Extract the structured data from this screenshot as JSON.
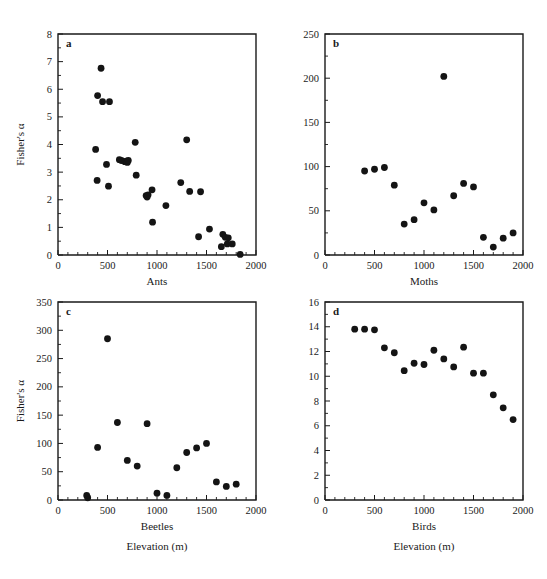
{
  "figure": {
    "y_axis_label": "Fisher's α",
    "shared_x_label": "Elevation (m)"
  },
  "chart_data": [
    {
      "type": "scatter",
      "panel": "a",
      "title": "",
      "xlabel": "Ants",
      "ylabel": "Fisher's α",
      "xlim": [
        0,
        2000
      ],
      "ylim": [
        0,
        8
      ],
      "xticks": [
        0,
        500,
        1000,
        1500,
        2000
      ],
      "yticks": [
        0,
        1,
        2,
        3,
        4,
        5,
        6,
        7,
        8
      ],
      "grid": false,
      "legend": "none",
      "x": [
        380,
        395,
        400,
        435,
        450,
        490,
        510,
        520,
        620,
        640,
        675,
        690,
        700,
        710,
        780,
        790,
        890,
        900,
        910,
        950,
        955,
        1090,
        1240,
        1300,
        1330,
        1420,
        1440,
        1530,
        1650,
        1665,
        1690,
        1710,
        1720,
        1760,
        1840
      ],
      "y": [
        3.82,
        2.7,
        5.77,
        6.76,
        5.55,
        3.28,
        2.49,
        5.55,
        3.45,
        3.42,
        3.38,
        3.4,
        3.35,
        3.42,
        4.08,
        2.89,
        2.15,
        2.1,
        2.18,
        2.36,
        1.19,
        1.79,
        2.62,
        4.17,
        2.3,
        0.66,
        2.29,
        0.94,
        0.3,
        0.75,
        0.64,
        0.4,
        0.62,
        0.4,
        0.02
      ]
    },
    {
      "type": "scatter",
      "panel": "b",
      "title": "",
      "xlabel": "Moths",
      "ylabel": "Fisher's α",
      "xlim": [
        0,
        2000
      ],
      "ylim": [
        0,
        250
      ],
      "xticks": [
        0,
        500,
        1000,
        1500,
        2000
      ],
      "yticks": [
        0,
        50,
        100,
        150,
        200,
        250
      ],
      "grid": false,
      "legend": "none",
      "x": [
        400,
        500,
        600,
        700,
        800,
        900,
        1000,
        1100,
        1200,
        1300,
        1400,
        1500,
        1600,
        1700,
        1800,
        1900
      ],
      "y": [
        95,
        97,
        99,
        79,
        35,
        40,
        59,
        51,
        202,
        67,
        81,
        77,
        20,
        9,
        19,
        25
      ]
    },
    {
      "type": "scatter",
      "panel": "c",
      "title": "",
      "xlabel": "Beetles",
      "ylabel": "Fisher's α",
      "xlim": [
        0,
        2000
      ],
      "ylim": [
        0,
        350
      ],
      "xticks": [
        0,
        500,
        1000,
        1500,
        2000
      ],
      "yticks": [
        0,
        50,
        100,
        150,
        200,
        250,
        300,
        350
      ],
      "grid": false,
      "legend": "none",
      "x": [
        290,
        300,
        400,
        500,
        600,
        700,
        800,
        900,
        1000,
        1100,
        1200,
        1300,
        1400,
        1500,
        1600,
        1700,
        1800
      ],
      "y": [
        8,
        4,
        93,
        285,
        137,
        70,
        60,
        135,
        12,
        8,
        57,
        84,
        92,
        100,
        32,
        24,
        28
      ]
    },
    {
      "type": "scatter",
      "panel": "d",
      "title": "",
      "xlabel": "Birds",
      "ylabel": "Fisher's α",
      "xlim": [
        0,
        2000
      ],
      "ylim": [
        0,
        16
      ],
      "xticks": [
        0,
        500,
        1000,
        1500,
        2000
      ],
      "yticks": [
        0,
        2,
        4,
        6,
        8,
        10,
        12,
        14,
        16
      ],
      "grid": false,
      "legend": "none",
      "x": [
        300,
        400,
        500,
        600,
        700,
        800,
        900,
        1000,
        1100,
        1200,
        1300,
        1400,
        1500,
        1600,
        1700,
        1800,
        1900
      ],
      "y": [
        13.8,
        13.8,
        13.75,
        12.3,
        11.9,
        10.45,
        11.05,
        10.95,
        12.1,
        11.4,
        10.75,
        12.35,
        10.25,
        10.25,
        8.5,
        7.45,
        6.5
      ]
    }
  ],
  "panels": {
    "a": {
      "letter": "a",
      "xlabel": "Ants",
      "ylabel": "Fisher's α"
    },
    "b": {
      "letter": "b",
      "xlabel": "Moths",
      "ylabel": ""
    },
    "c": {
      "letter": "c",
      "xlabel": "Beetles",
      "ylabel": "Fisher's α",
      "sublabel": "Elevation (m)"
    },
    "d": {
      "letter": "d",
      "xlabel": "Birds",
      "ylabel": "",
      "sublabel": "Elevation (m)"
    }
  }
}
